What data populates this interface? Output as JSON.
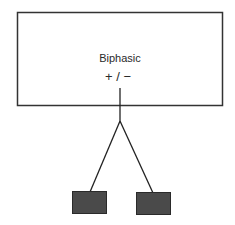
{
  "diagram": {
    "device_box": {
      "title": "Biphasic",
      "polarity": "+ / −",
      "stroke": "#333333",
      "fill": "#ffffff"
    },
    "lead": {
      "stroke": "#222222"
    },
    "electrodes": [
      {
        "name": "left-electrode",
        "fill": "#4a4a4a",
        "stroke": "#2a2a2a"
      },
      {
        "name": "right-electrode",
        "fill": "#4a4a4a",
        "stroke": "#2a2a2a"
      }
    ]
  }
}
